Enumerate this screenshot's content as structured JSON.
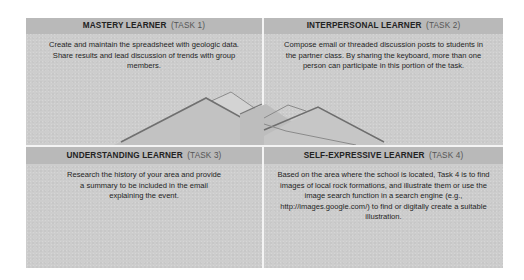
{
  "panels": [
    {
      "title": "MASTERY LEARNER",
      "task": "(TASK 1)",
      "body": "Create and maintain the spreadsheet with geologic data. Share results and lead discussion of trends with group members."
    },
    {
      "title": "INTERPERSONAL LEARNER",
      "task": "(TASK 2)",
      "body": "Compose email or threaded discussion posts to students in the partner class. By sharing the keyboard, more than one person can participate in this portion of the task."
    },
    {
      "title": "UNDERSTANDING LEARNER",
      "task": "(TASK 3)",
      "body": "Research the history of your area and provide a summary to be included in the email explaining the event."
    },
    {
      "title": "SELF-EXPRESSIVE LEARNER",
      "task": "(TASK 4)",
      "body": "Based on the area where the school is located, Task 4 is to find images of local rock formations, and illustrate them or use the image search function in a search engine (e.g., http://images.google.com/) to find or digitally create a suitable illustration."
    }
  ],
  "illustration": {
    "icon": "mountains-icon",
    "colors": {
      "ridge": "#7a7a7a",
      "fill_dark": "#bdbdbd",
      "fill_light": "#d6d6d6"
    }
  }
}
